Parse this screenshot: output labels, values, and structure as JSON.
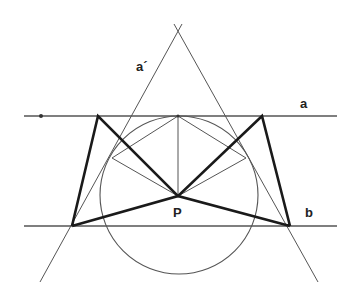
{
  "diagram": {
    "labels": {
      "line_a": "a",
      "line_a_prime": "a´",
      "line_b": "b",
      "point_p": "P"
    },
    "colors": {
      "background": "#ffffff",
      "thin_line": "#555555",
      "thick_line": "#1a1a1a",
      "circle": "#555555"
    },
    "elements": {
      "line_a": {
        "x1": 24,
        "y1": 116,
        "x2": 337,
        "y2": 116
      },
      "line_b": {
        "x1": 24,
        "y1": 226,
        "x2": 337,
        "y2": 226
      },
      "point_on_a": {
        "cx": 41,
        "cy": 116
      },
      "point_p": {
        "cx": 178,
        "cy": 196
      },
      "circle": {
        "cx": 179,
        "cy": 195,
        "r": 79
      },
      "apex": {
        "x": 178,
        "y": 30
      }
    }
  }
}
